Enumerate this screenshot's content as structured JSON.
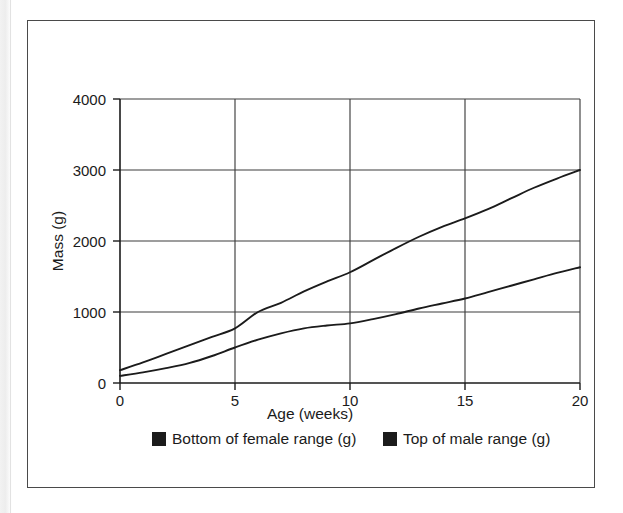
{
  "figure": {
    "background_color": "#ffffff",
    "border_color": "#4a4a4a",
    "line_color": "#1b1b1b",
    "grid_color": "#3d3d3d"
  },
  "chart_data": {
    "type": "line",
    "title": "",
    "subtitle": "",
    "xlabel": "Age (weeks)",
    "ylabel": "Mass (g)",
    "xlim": [
      0,
      20
    ],
    "ylim": [
      0,
      4000
    ],
    "xticks": [
      0,
      5,
      10,
      15,
      20
    ],
    "xtick_labels": [
      "0",
      "5",
      "10",
      "15",
      "20"
    ],
    "yticks": [
      0,
      1000,
      2000,
      3000,
      4000
    ],
    "ytick_labels": [
      "0",
      "1000",
      "2000",
      "3000",
      "4000"
    ],
    "grid": true,
    "grid_axis": "both",
    "legend_position": "bottom",
    "x": [
      0,
      1,
      2,
      3,
      4,
      5,
      6,
      7,
      8,
      9,
      10,
      11,
      12,
      13,
      14,
      15,
      16,
      17,
      18,
      19,
      20
    ],
    "series": [
      {
        "name": "Bottom of female range (g)",
        "marker": "square",
        "color": "#1b1b1b",
        "values": [
          100,
          150,
          210,
          280,
          380,
          500,
          610,
          700,
          770,
          810,
          840,
          900,
          970,
          1050,
          1120,
          1190,
          1280,
          1370,
          1460,
          1550,
          1630
        ]
      },
      {
        "name": "Top of male range (g)",
        "marker": "square",
        "color": "#1b1b1b",
        "values": [
          180,
          290,
          410,
          530,
          650,
          770,
          1000,
          1130,
          1290,
          1430,
          1560,
          1730,
          1900,
          2060,
          2200,
          2320,
          2450,
          2600,
          2750,
          2880,
          3000
        ]
      }
    ],
    "annotations": []
  },
  "legend": {
    "entries": [
      {
        "label": "Bottom of female range (g)",
        "swatch_color": "#1b1b1b",
        "swatch_shape": "square"
      },
      {
        "label": "Top of male range (g)",
        "swatch_color": "#1b1b1b",
        "swatch_shape": "square"
      }
    ]
  }
}
